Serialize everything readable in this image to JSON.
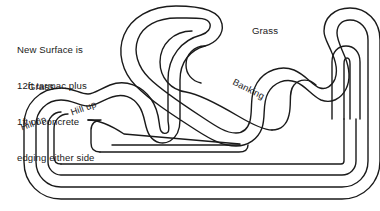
{
  "diagram": {
    "kind": "racing-circuit-map",
    "width": 380,
    "height": 211,
    "background_color": "#ffffff",
    "line_color": "#1a1a1a",
    "line_width": 1.4
  },
  "annotations": {
    "note": {
      "line1": "New Surface is",
      "line2": "12ft tarmac plus",
      "line3": "1ft of concrete",
      "line4": "edging either side"
    },
    "grass_left": "Grass",
    "grass_right": "Grass",
    "banking": "Banking",
    "hill_up_1": "Hill up",
    "hill_up_2": "Hill up"
  }
}
